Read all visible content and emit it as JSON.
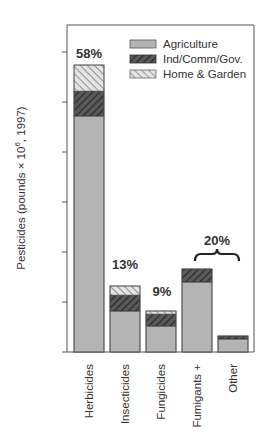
{
  "chart_data": {
    "type": "bar",
    "stacked": true,
    "title": "",
    "xlabel": "",
    "ylabel": "Pesticides (pounds × 10⁶, 1997)",
    "ylabel_parts": {
      "main": "Pesticides (pounds × 10",
      "sup": "6",
      "tail": ", 1997)"
    },
    "ylim": [
      0,
      654
    ],
    "yticks": [
      100,
      200,
      300,
      400,
      500,
      600
    ],
    "ytick_labels_shown": false,
    "grid": false,
    "legend_position": "top-right",
    "categories": [
      "Herbicides",
      "Insecticides",
      "Fungicides",
      "Fumigants +",
      "Other"
    ],
    "series": [
      {
        "name": "Agriculture",
        "pattern": "solid-grey",
        "values": [
          472,
          82,
          52,
          140,
          26
        ]
      },
      {
        "name": "Ind/Comm/Gov.",
        "pattern": "dark-hatch",
        "values": [
          50,
          32,
          24,
          26,
          6
        ]
      },
      {
        "name": "Home & Garden",
        "pattern": "light-hatch",
        "values": [
          52,
          18,
          6,
          0,
          0
        ]
      }
    ],
    "annotations": [
      {
        "text": "58%",
        "category": "Herbicides",
        "bold": true
      },
      {
        "text": "13%",
        "category": "Insecticides",
        "bold": true
      },
      {
        "text": "9%",
        "category": "Fungicides",
        "bold": true
      },
      {
        "text": "20%",
        "category": [
          "Fumigants +",
          "Other"
        ],
        "bracket": "curly-brace",
        "bold": true
      }
    ]
  },
  "colors": {
    "agriculture": "#b4b4b4",
    "ind_fill": "#5a5a5a",
    "ind_stripe": "#2e2e2e",
    "home_fill": "#e2e2e2",
    "home_stripe": "#8a8a8a",
    "axis": "#555555",
    "text": "#333333"
  }
}
